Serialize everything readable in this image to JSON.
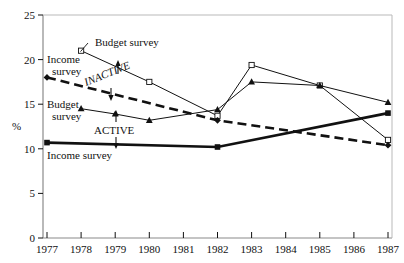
{
  "chart_data": {
    "type": "line",
    "title": "",
    "xlabel": "",
    "ylabel": "%",
    "x": [
      1977,
      1978,
      1979,
      1980,
      1981,
      1982,
      1983,
      1984,
      1985,
      1986,
      1987
    ],
    "xlim": [
      1977,
      1987
    ],
    "ylim": [
      0,
      25
    ],
    "yticks": [
      0,
      5,
      10,
      15,
      20,
      25
    ],
    "xticks": [
      "1977",
      "1978",
      "1979",
      "1980",
      "1981",
      "1982",
      "1983",
      "1984",
      "1985",
      "1986",
      "1987"
    ],
    "grid": false,
    "legend": "inline-annotations",
    "series": [
      {
        "name": "Inactive - Budget survey",
        "group": "INACTIVE",
        "source": "Budget survey",
        "marker": "open-square",
        "linestyle": "thin-solid",
        "x": [
          1978,
          1980,
          1982,
          1983,
          1985,
          1987
        ],
        "values": [
          21.0,
          17.5,
          13.7,
          19.4,
          17.1,
          11.0
        ]
      },
      {
        "name": "Inactive - Income survey",
        "group": "INACTIVE",
        "source": "Income survey",
        "marker": "filled-diamond",
        "linestyle": "thick-dashed",
        "x": [
          1977,
          1982,
          1987
        ],
        "values": [
          18.0,
          13.2,
          10.4
        ]
      },
      {
        "name": "Active - Budget survey",
        "group": "ACTIVE",
        "source": "Budget survey",
        "marker": "filled-triangle",
        "linestyle": "thin-solid",
        "x": [
          1978,
          1979,
          1980,
          1982,
          1983,
          1985,
          1987
        ],
        "values": [
          14.5,
          13.9,
          13.2,
          14.4,
          17.5,
          17.1,
          15.2
        ]
      },
      {
        "name": "Active - Income survey",
        "group": "ACTIVE",
        "source": "Income survey",
        "marker": "filled-square",
        "linestyle": "thick-solid",
        "x": [
          1977,
          1982,
          1987
        ],
        "values": [
          10.7,
          10.2,
          14.0
        ]
      }
    ],
    "annotations": [
      {
        "name": "budget-survey-top",
        "text": "Budget survey"
      },
      {
        "name": "income-survey-left",
        "text": "Income survey"
      },
      {
        "name": "budget-survey-left",
        "text": "Budget survey"
      },
      {
        "name": "income-survey-bottom",
        "text": "Income survey"
      },
      {
        "name": "inactive-group",
        "text": "INACTIVE"
      },
      {
        "name": "active-group",
        "text": "ACTIVE"
      }
    ]
  },
  "axis": {
    "y_label": "%",
    "y_ticks": [
      "25",
      "20",
      "15",
      "10",
      "5",
      "0"
    ],
    "x_ticks": [
      "1977",
      "1978",
      "1979",
      "1980",
      "1981",
      "1982",
      "1983",
      "1984",
      "1985",
      "1986",
      "1987"
    ]
  },
  "labels": {
    "budget_survey_top": "Budget survey",
    "income_survey_upper": "Income",
    "income_survey_upper2": "survey",
    "budget_survey_mid": "Budget",
    "budget_survey_mid2": "survey",
    "income_survey_lower": "Income survey",
    "inactive": "INACTIVE",
    "active": "ACTIVE"
  },
  "colors": {
    "ink": "#111111",
    "axis": "#888888",
    "background": "#ffffff"
  }
}
